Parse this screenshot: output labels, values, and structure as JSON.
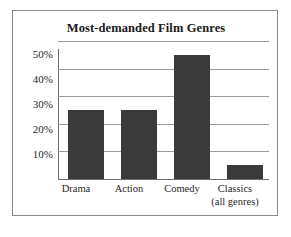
{
  "figure": {
    "title": "Most-demanded Film Genres",
    "border_color": "#8a8a8a",
    "background": "#ffffff"
  },
  "chart_data": {
    "type": "bar",
    "title": "Most-demanded Film Genres",
    "xlabel": "",
    "ylabel": "",
    "categories": [
      "Drama",
      "Action",
      "Comedy",
      "Classics"
    ],
    "category_sublabels": [
      "",
      "",
      "",
      "(all genres)"
    ],
    "values": [
      25,
      25,
      45,
      5
    ],
    "value_labels": [
      "25%",
      "25%",
      "45%",
      "5%"
    ],
    "ylim": [
      0,
      50
    ],
    "ytick_values": [
      10,
      20,
      30,
      40,
      50
    ],
    "ytick_labels": [
      "10%",
      "20%",
      "30%",
      "40%",
      "50%"
    ],
    "grid": true,
    "grid_axis": "y",
    "grid_color": "#9b9b9b",
    "legend": false,
    "legend_position": "none",
    "bar_color": "#3a3a3a",
    "axis_color": "#6f6f6f",
    "series": [
      {
        "name": "Share of demand",
        "values": [
          25,
          25,
          45,
          5
        ]
      }
    ]
  }
}
